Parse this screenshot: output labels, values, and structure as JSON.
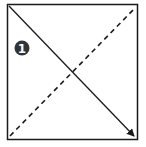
{
  "diagram": {
    "type": "square-with-diagonals",
    "frame": {
      "x1": 7,
      "y1": 4,
      "x2": 138,
      "y2": 140,
      "stroke": "#1a1a1a"
    },
    "solid_arrow": {
      "from": "top-left",
      "to": "bottom-right",
      "color": "#1a1a1a",
      "style": "solid",
      "arrowhead": true
    },
    "dashed_line": {
      "from": "bottom-left",
      "to": "top-right",
      "color": "#1a1a1a",
      "style": "dashed"
    },
    "badge": {
      "label": "1",
      "fill": "#333333",
      "text_color": "#ffffff"
    }
  }
}
